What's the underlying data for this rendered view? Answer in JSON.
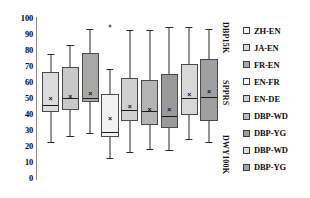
{
  "chart_data": {
    "type": "box",
    "title": "",
    "xlabel": "",
    "ylabel": "",
    "ylim": [
      0,
      100
    ],
    "grid": false,
    "legend_position": "right",
    "yticks": [
      "100",
      "90",
      "80",
      "70",
      "60",
      "50",
      "40",
      "30",
      "20",
      "10",
      "0"
    ],
    "group_labels": [
      "DBP15K",
      "SPPRS",
      "DWY100K"
    ],
    "categories": [
      "ZH-EN",
      "JA-EN",
      "FR-EN",
      "EN-FR",
      "EN-DE",
      "DBP-WD",
      "DBP-YG",
      "DBP-WD",
      "DBP-YG"
    ],
    "series": [
      {
        "name": "ZH-EN",
        "group": "DBP15K",
        "color": "#dcdcdc",
        "whisker_low": 22,
        "q1": 41,
        "median": 46,
        "mean": 50,
        "q3": 66,
        "whisker_high": 77,
        "outliers": []
      },
      {
        "name": "JA-EN",
        "group": "DBP15K",
        "color": "#c8c8c8",
        "whisker_low": 26,
        "q1": 42,
        "median": 50,
        "mean": 51,
        "q3": 69,
        "whisker_high": 83,
        "outliers": []
      },
      {
        "name": "FR-EN",
        "group": "DBP15K",
        "color": "#a8a8a8",
        "whisker_low": 28,
        "q1": 47,
        "median": 50,
        "mean": 53,
        "q3": 78,
        "whisker_high": 93,
        "outliers": []
      },
      {
        "name": "EN-FR",
        "group": "SPPRS",
        "color": "#f2f2f2",
        "whisker_low": 12,
        "q1": 25,
        "median": 29,
        "mean": 37,
        "q3": 52,
        "whisker_high": 68,
        "outliers": [
          95
        ]
      },
      {
        "name": "EN-DE",
        "group": "SPPRS",
        "color": "#d0d0d0",
        "whisker_low": 16,
        "q1": 35,
        "median": 43,
        "mean": 45,
        "q3": 62,
        "whisker_high": 92,
        "outliers": []
      },
      {
        "name": "DBP-WD",
        "group": "SPPRS",
        "color": "#b4b4b4",
        "whisker_low": 18,
        "q1": 33,
        "median": 42,
        "mean": 43,
        "q3": 61,
        "whisker_high": 92,
        "outliers": []
      },
      {
        "name": "DBP-YG",
        "group": "SPPRS",
        "color": "#9a9a9a",
        "whisker_low": 17,
        "q1": 31,
        "median": 39,
        "mean": 43,
        "q3": 65,
        "whisker_high": 94,
        "outliers": []
      },
      {
        "name": "DBP-WD",
        "group": "DWY100K",
        "color": "#d8d8d8",
        "whisker_low": 24,
        "q1": 39,
        "median": 50,
        "mean": 52,
        "q3": 71,
        "whisker_high": 94,
        "outliers": []
      },
      {
        "name": "DBP-YG",
        "group": "DWY100K",
        "color": "#a0a0a0",
        "whisker_low": 22,
        "q1": 35,
        "median": 51,
        "mean": 54,
        "q3": 74,
        "whisker_high": 93,
        "outliers": []
      }
    ]
  },
  "legend": {
    "items": [
      {
        "label": "ZH-EN",
        "color": "#f5f5f5"
      },
      {
        "label": "JA-EN",
        "color": "#dadada"
      },
      {
        "label": "FR-EN",
        "color": "#a8a8a8"
      },
      {
        "label": "EN-FR",
        "color": "#fbfbfb"
      },
      {
        "label": "EN-DE",
        "color": "#d2d2d2"
      },
      {
        "label": "DBP-WD",
        "color": "#b8b8b8"
      },
      {
        "label": "DBP-YG",
        "color": "#9c9c9c"
      },
      {
        "label": "DBP-WD",
        "color": "#dcdcdc"
      },
      {
        "label": "DBP-YG",
        "color": "#a4a4a4"
      }
    ]
  },
  "axis": {
    "y_max_label": "100",
    "y_min_label": "0"
  }
}
